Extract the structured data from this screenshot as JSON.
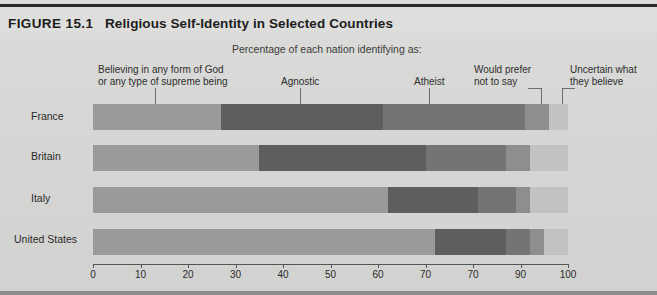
{
  "figure": {
    "label": "FIGURE 15.1",
    "title": "Religious Self-Identity in Selected Countries",
    "subtitle": "Percentage of each nation identifying as:"
  },
  "legend": {
    "believing_line1": "Believing in any form of God",
    "believing_line2": "or any type of supreme being",
    "agnostic": "Agnostic",
    "atheist": "Atheist",
    "prefer_line1": "Would prefer",
    "prefer_line2": "not to say",
    "uncertain_line1": "Uncertain what",
    "uncertain_line2": "they believe"
  },
  "countries": {
    "france": "France",
    "britain": "Britain",
    "italy": "Italy",
    "united_states": "United States"
  },
  "axis": {
    "ticks": [
      "0",
      "10",
      "20",
      "30",
      "40",
      "50",
      "60",
      "70",
      "70",
      "90",
      "100"
    ]
  },
  "colors": {
    "believing": "#9a9a9a",
    "agnostic": "#5e5e5e",
    "atheist": "#747474",
    "prefer_not_to_say": "#8e8e8e",
    "uncertain": "#c2c2c0",
    "background": "#d8d8d6",
    "title_rule": "#2a2a2a"
  },
  "chart_data": {
    "type": "bar",
    "orientation": "horizontal",
    "stacked": true,
    "title": "Religious Self-Identity in Selected Countries",
    "subtitle": "Percentage of each nation identifying as:",
    "xlabel": "",
    "ylabel": "",
    "xlim": [
      0,
      100
    ],
    "xticks": [
      0,
      10,
      20,
      30,
      40,
      50,
      60,
      70,
      80,
      90,
      100
    ],
    "xtick_labels": [
      "0",
      "10",
      "20",
      "30",
      "40",
      "50",
      "60",
      "70",
      "70",
      "90",
      "100"
    ],
    "grid": false,
    "legend_position": "top",
    "categories": [
      "France",
      "Britain",
      "Italy",
      "United States"
    ],
    "series": [
      {
        "name": "Believing in any form of God or any type of supreme being",
        "values": [
          27,
          35,
          62,
          72
        ]
      },
      {
        "name": "Agnostic",
        "values": [
          34,
          35,
          19,
          15
        ]
      },
      {
        "name": "Atheist",
        "values": [
          30,
          17,
          8,
          5
        ]
      },
      {
        "name": "Would prefer not to say",
        "values": [
          5,
          5,
          3,
          3
        ]
      },
      {
        "name": "Uncertain what they believe",
        "values": [
          4,
          8,
          8,
          5
        ]
      }
    ]
  }
}
